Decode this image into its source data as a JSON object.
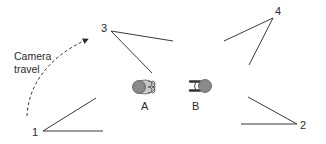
{
  "diagram": {
    "type": "camera-placement",
    "colors": {
      "line": "#3a3a3a",
      "figure_fill": "#8a8a8a",
      "figure_outline": "#555555",
      "text": "#2b2b2b"
    },
    "travel_label": {
      "line1": "Camera",
      "line2": "travel"
    },
    "cameras": [
      {
        "id": "1",
        "label": "1"
      },
      {
        "id": "2",
        "label": "2"
      },
      {
        "id": "3",
        "label": "3"
      },
      {
        "id": "4",
        "label": "4"
      }
    ],
    "subjects": [
      {
        "id": "A",
        "label": "A"
      },
      {
        "id": "B",
        "label": "B"
      }
    ]
  }
}
